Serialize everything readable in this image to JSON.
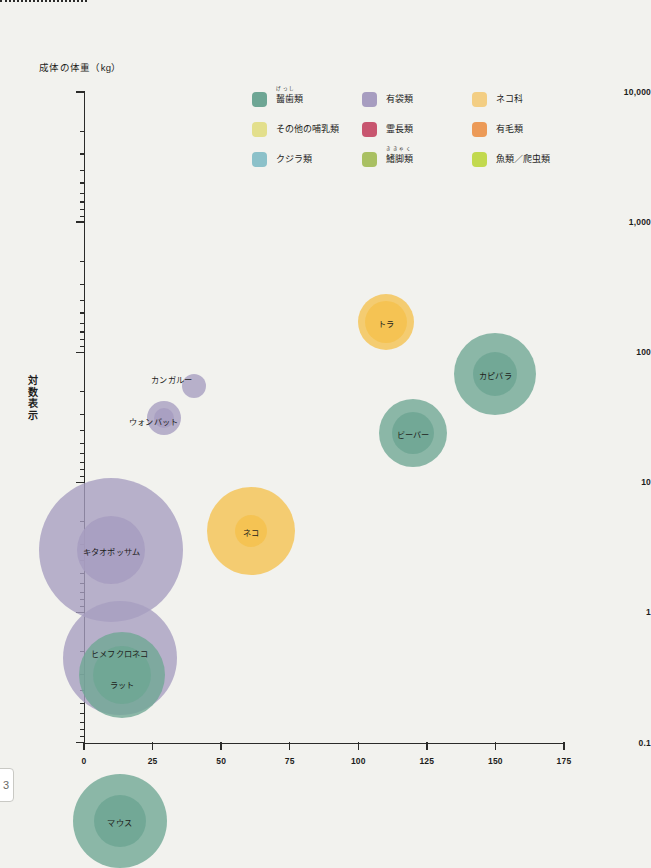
{
  "page": {
    "number": "3"
  },
  "axes": {
    "y_title": "成体の体重（kg）",
    "y_scale_label": "対数表示",
    "y_ticks": [
      "10,000",
      "1,000",
      "100",
      "10",
      "1",
      "0.1"
    ],
    "y_values": [
      10000,
      1000,
      100,
      10,
      1,
      0.1
    ],
    "x_ticks": [
      "0",
      "25",
      "50",
      "75",
      "100",
      "125",
      "150",
      "175"
    ],
    "x_values": [
      0,
      25,
      50,
      75,
      100,
      125,
      150,
      175
    ],
    "x_continues_dotted_to": "200"
  },
  "legend": {
    "items": [
      {
        "label": "齧歯類",
        "furigana": "げっし",
        "color": "#6ea694"
      },
      {
        "label": "その他の哺乳類",
        "furigana": "",
        "color": "#e3df8c"
      },
      {
        "label": "クジラ類",
        "furigana": "",
        "color": "#8cc1c9"
      },
      {
        "label": "有袋類",
        "furigana": "",
        "color": "#a79dc0"
      },
      {
        "label": "霊長類",
        "furigana": "",
        "color": "#c8566f"
      },
      {
        "label": "鰭脚類",
        "furigana": "ききゃく",
        "color": "#a9c062"
      },
      {
        "label": "ネコ科",
        "furigana": "",
        "color": "#f3ce83"
      },
      {
        "label": "有毛類",
        "furigana": "",
        "color": "#ec9a57"
      },
      {
        "label": "魚類／爬虫類",
        "furigana": "",
        "color": "#c2d94e"
      }
    ]
  },
  "chart_data": {
    "type": "scatter",
    "title": "",
    "xlabel": "",
    "ylabel": "成体の体重（kg）",
    "yscale": "log",
    "ylim": [
      0.1,
      10000
    ],
    "xlim": [
      0,
      200
    ],
    "grid": false,
    "legend_position": "top",
    "points": [
      {
        "name": "トラ",
        "x": 110,
        "y": 170,
        "group": "ネコ科",
        "color": "#f5c24e",
        "r_outer": 28,
        "r_inner": 21,
        "label_dx": 0,
        "label_dy": 0
      },
      {
        "name": "カピバラ",
        "x": 150,
        "y": 68,
        "group": "齧歯類",
        "color": "#6ea694",
        "r_outer": 41,
        "r_inner": 22,
        "label_dx": 0,
        "label_dy": 0
      },
      {
        "name": "ビーバー",
        "x": 120,
        "y": 24,
        "group": "齧歯類",
        "color": "#6ea694",
        "r_outer": 34,
        "r_inner": 21,
        "label_dx": 0,
        "label_dy": 0
      },
      {
        "name": "カンガルー",
        "x": 40,
        "y": 55,
        "group": "有袋類",
        "color": "#a79dc0",
        "r_outer": 12,
        "r_inner": 0,
        "label_dx": -22,
        "label_dy": -8
      },
      {
        "name": "ウォンバット",
        "x": 29,
        "y": 31,
        "group": "有袋類",
        "color": "#a79dc0",
        "r_outer": 17,
        "r_inner": 10,
        "label_dx": -10,
        "label_dy": 2
      },
      {
        "name": "ネコ",
        "x": 61,
        "y": 4.2,
        "group": "ネコ科",
        "color": "#f5c24e",
        "r_outer": 44,
        "r_inner": 16,
        "label_dx": 0,
        "label_dy": 0
      },
      {
        "name": "キタオポッサム",
        "x": 10,
        "y": 3.0,
        "group": "有袋類",
        "color": "#a79dc0",
        "r_outer": 72,
        "r_inner": 34,
        "label_dx": 0,
        "label_dy": 0
      },
      {
        "name": "ヒメフクロネコ",
        "x": 13,
        "y": 0.45,
        "group": "有袋類",
        "color": "#a79dc0",
        "r_outer": 57,
        "r_inner": 0,
        "label_dx": 0,
        "label_dy": -6
      },
      {
        "name": "ラット",
        "x": 14,
        "y": 0.33,
        "group": "齧歯類",
        "color": "#6ea694",
        "r_outer": 43,
        "r_inner": 29,
        "label_dx": 0,
        "label_dy": 8
      },
      {
        "name": "マウス",
        "x": 13,
        "y": 0.025,
        "group": "齧歯類",
        "color": "#6ea694",
        "r_outer": 47,
        "r_inner": 26,
        "label_dx": 0,
        "label_dy": 0
      }
    ]
  }
}
